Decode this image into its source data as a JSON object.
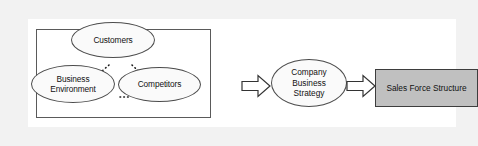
{
  "figure": {
    "type": "flow-diagram"
  },
  "colors": {
    "page_margin": "#f2f2f2",
    "panel_background": "#ffffff",
    "group_box_border": "#5a5a5a",
    "ellipse_fill": "#fafafa",
    "ellipse_border": "#4c4c4c",
    "result_box_fill": "#c0c0c0",
    "result_box_border": "#3d3d3d",
    "connector": "#1a1a1a",
    "arrow_fill": "#ffffff",
    "arrow_border": "#333333",
    "text": "#111111"
  },
  "environment_group": {
    "label": "",
    "nodes": [
      {
        "id": "customers",
        "label": "Customers"
      },
      {
        "id": "business-environment",
        "line1": "Business",
        "line2": "Environment"
      },
      {
        "id": "competitors",
        "label": "Competitors"
      }
    ],
    "connectors": [
      {
        "from": "customers",
        "to": "business-environment",
        "style": "dotted"
      },
      {
        "from": "customers",
        "to": "competitors",
        "style": "dotted"
      },
      {
        "from": "business-environment",
        "to": "competitors",
        "style": "dotted"
      }
    ]
  },
  "strategy_node": {
    "line1": "Company",
    "line2": "Business",
    "line3": "Strategy"
  },
  "result_node": {
    "label": "Sales Force Structure"
  },
  "arrows": [
    {
      "id": "env-to-strategy",
      "direction": "right",
      "from": "environment-group",
      "to": "strategy_node"
    },
    {
      "id": "strategy-to-structure",
      "direction": "right",
      "from": "strategy_node",
      "to": "result_node"
    }
  ]
}
